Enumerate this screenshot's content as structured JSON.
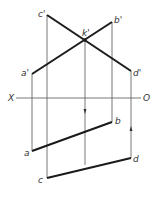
{
  "diagram": {
    "axis": {
      "left_label": "X",
      "right_label": "O"
    },
    "points_front": {
      "c": "c'",
      "b": "b'",
      "k": "k'",
      "a": "a'",
      "d": "d'"
    },
    "points_top": {
      "b": "b",
      "a": "a",
      "d": "d",
      "c": "c"
    },
    "colors": {
      "thick": "#1a1a1a",
      "thin": "#555555"
    }
  }
}
